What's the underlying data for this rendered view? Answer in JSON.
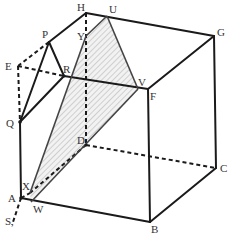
{
  "figure": {
    "colors": {
      "line": "#1a1a1a",
      "shade": "#c8c8c8",
      "label": "#333333"
    },
    "labels": {
      "A": "A",
      "B": "B",
      "C": "C",
      "D": "D",
      "E": "E",
      "F": "F",
      "G": "G",
      "H": "H",
      "P": "P",
      "Q": "Q",
      "R": "R",
      "S": "S,",
      "U": "U",
      "V": "V",
      "W": "W",
      "X": "X",
      "Y": "Y"
    }
  }
}
